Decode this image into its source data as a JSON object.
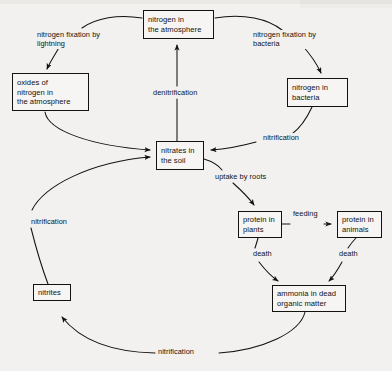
{
  "diagram": {
    "type": "flow-diagram",
    "background_color": "#f2f1ef",
    "line_color": "#14120f",
    "text_color": "#111111",
    "nodes": [
      {
        "id": "atmosphere",
        "label": "nitrogen in\nthe atmosphere",
        "x": 143,
        "y": 10,
        "w": 71,
        "h": 29
      },
      {
        "id": "oxides",
        "label": "oxides of\nnitrogen in\nthe atmosphere",
        "x": 12,
        "y": 73,
        "w": 77,
        "h": 38
      },
      {
        "id": "bacteria",
        "label": "nitrogen in\nbacteria",
        "x": 287,
        "y": 78,
        "w": 61,
        "h": 29
      },
      {
        "id": "nitrates",
        "label": "nitrates in\nthe soil",
        "x": 156,
        "y": 141,
        "w": 48,
        "h": 29
      },
      {
        "id": "plants",
        "label": "protein in\nplants",
        "x": 238,
        "y": 211,
        "w": 44,
        "h": 27
      },
      {
        "id": "animals",
        "label": "protein in\nanimals",
        "x": 337,
        "y": 211,
        "w": 45,
        "h": 27
      },
      {
        "id": "ammonia",
        "label": "ammonia in dead\norganic matter",
        "x": 272,
        "y": 285,
        "w": 74,
        "h": 27
      },
      {
        "id": "nitrites",
        "label": "nitrites",
        "x": 33,
        "y": 284,
        "w": 38,
        "h": 17
      }
    ],
    "edge_labels": [
      {
        "id": "fix-lightning",
        "text": "nitrogen fixation by\nlightning",
        "x": 36,
        "y": 30
      },
      {
        "id": "fix-bacteria",
        "text": "nitrogen fixation by\nbacteria",
        "x": 252,
        "y": 30
      },
      {
        "id": "denitrification",
        "text": "denitrification",
        "x": 152,
        "y": 88
      },
      {
        "id": "nitrification-bacteria",
        "text": "nitrification",
        "x": 262,
        "y": 133
      },
      {
        "id": "uptake-by-roots",
        "text": "uptake by roots",
        "x": 214,
        "y": 172
      },
      {
        "id": "nitrification-nitrites",
        "text": "nitrification",
        "x": 30,
        "y": 217
      },
      {
        "id": "feeding",
        "text": "feeding",
        "x": 294,
        "y": 209
      },
      {
        "id": "death-plants",
        "text": "death",
        "x": 253,
        "y": 250
      },
      {
        "id": "death-animals",
        "text": "death",
        "x": 339,
        "y": 250
      },
      {
        "id": "nitrification-ammonia",
        "text": "nitrification",
        "x": 157,
        "y": 347
      }
    ],
    "edges": [
      {
        "from": "atmosphere",
        "to": "oxides",
        "label": "nitrogen fixation by lightning"
      },
      {
        "from": "atmosphere",
        "to": "bacteria",
        "label": "nitrogen fixation by bacteria"
      },
      {
        "from": "oxides",
        "to": "nitrates",
        "label": ""
      },
      {
        "from": "bacteria",
        "to": "nitrates",
        "label": "nitrification"
      },
      {
        "from": "nitrates",
        "to": "atmosphere",
        "label": "denitrification"
      },
      {
        "from": "nitrates",
        "to": "plants",
        "label": "uptake by roots"
      },
      {
        "from": "plants",
        "to": "animals",
        "label": "feeding"
      },
      {
        "from": "plants",
        "to": "ammonia",
        "label": "death"
      },
      {
        "from": "animals",
        "to": "ammonia",
        "label": "death"
      },
      {
        "from": "ammonia",
        "to": "nitrites",
        "label": "nitrification"
      },
      {
        "from": "nitrites",
        "to": "nitrates",
        "label": "nitrification"
      }
    ]
  }
}
